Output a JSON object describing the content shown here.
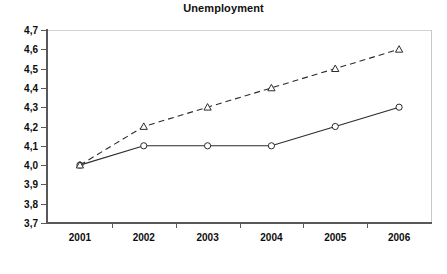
{
  "chart_data": {
    "type": "line",
    "title": "Unemployment",
    "xlabel": "",
    "ylabel": "",
    "categories": [
      "2001",
      "2002",
      "2003",
      "2004",
      "2005",
      "2006"
    ],
    "x_tick_labels": [
      "2001",
      "2002",
      "2003",
      "2004",
      "2005",
      "2006"
    ],
    "y_tick_labels": [
      "4,7",
      "4,6",
      "4,5",
      "4,4",
      "4,3",
      "4,2",
      "4,1",
      "4,0",
      "3,9",
      "3,8",
      "3,7"
    ],
    "y_tick_values": [
      4.7,
      4.6,
      4.5,
      4.4,
      4.3,
      4.2,
      4.1,
      4.0,
      3.9,
      3.8,
      3.7
    ],
    "ylim": [
      3.7,
      4.7
    ],
    "grid": false,
    "legend": "none",
    "decimal_separator": ",",
    "series": [
      {
        "name": "solid-series",
        "line_style": "solid",
        "marker": "circle",
        "color": "#2b2b2b",
        "values": [
          4.0,
          4.1,
          4.1,
          4.1,
          4.2,
          4.3
        ]
      },
      {
        "name": "dashed-series",
        "line_style": "dashed",
        "marker": "triangle",
        "color": "#2b2b2b",
        "values": [
          4.0,
          4.2,
          4.3,
          4.4,
          4.5,
          4.6
        ]
      }
    ]
  },
  "axes": {
    "axis_color": "#58585a",
    "frame_color": "#c8c8c8"
  }
}
